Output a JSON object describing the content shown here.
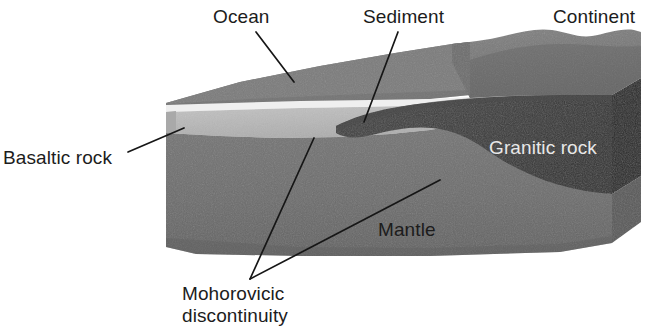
{
  "figure": {
    "background_color": "#ffffff"
  },
  "labels": {
    "ocean": "Ocean",
    "sediment": "Sediment",
    "continent": "Continent",
    "basaltic_rock": "Basaltic rock",
    "granitic_rock": "Granitic rock",
    "mantle": "Mantle",
    "moho_line1": "Mohorovicic",
    "moho_line2": "discontinuity"
  },
  "colors": {
    "ocean_water": "#7b7b7b",
    "ocean_top_face": "#828282",
    "seafloor_highlight": "#ededed",
    "basaltic_rock": "#b9b9b9",
    "basaltic_rock_shadow": "#a8a8a8",
    "mantle": "#6e6e6e",
    "mantle_front": "#6a6a6a",
    "mantle_side_dark": "#5a5a5a",
    "granitic_rock": "#3b3b3b",
    "granitic_rock_side": "#2a2a2a",
    "continent_surface": "#767676",
    "leader_line": "#161616",
    "label_dark": "#1c1c1c",
    "label_light": "#e8e8e8"
  },
  "layers": [
    {
      "name": "Ocean",
      "description": "Water body wedge on the left-hand top of the block"
    },
    {
      "name": "Sediment",
      "description": "Thin light layer on the ocean floor thickening toward the continental margin"
    },
    {
      "name": "Basaltic rock",
      "description": "Light grey oceanic crust layer beneath the sediment"
    },
    {
      "name": "Granitic rock",
      "description": "Dark wedge of continental crust thickening to the right"
    },
    {
      "name": "Mantle",
      "description": "Medium grey mass forming the bulk of the block below the Moho"
    },
    {
      "name": "Mohorovicic discontinuity",
      "description": "Boundary between crust (basaltic and granitic rock) and mantle"
    }
  ],
  "leaders": [
    {
      "from_label": "Ocean",
      "target": "ocean water body"
    },
    {
      "from_label": "Sediment",
      "target": "sediment layer at continental margin"
    },
    {
      "from_label": "Basaltic rock",
      "target": "basaltic crust layer on left face"
    },
    {
      "from_label": "Mohorovicic discontinuity",
      "target": "base of basaltic crust"
    },
    {
      "from_label": "Mohorovicic discontinuity",
      "target": "base of granitic crust"
    }
  ]
}
